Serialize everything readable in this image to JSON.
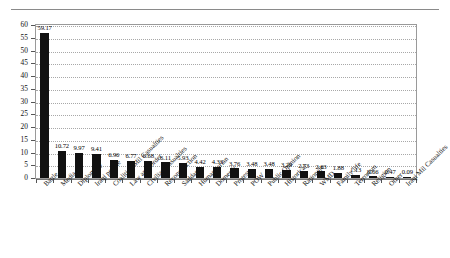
{
  "chart_data": {
    "type": "bar",
    "title": "",
    "subtitle": "",
    "xlabel": "",
    "ylabel": "",
    "ylim": [
      0,
      60
    ],
    "yticks": [
      0,
      5,
      10,
      15,
      20,
      25,
      30,
      35,
      40,
      45,
      50,
      55,
      60
    ],
    "grid": true,
    "legend": "none",
    "bar_color": "#111111",
    "categories": [
      "Battle",
      "Media",
      "Diplomacy",
      "Iraqi people",
      "Coalition Mil Casualties",
      "Law and Order",
      "Civilian Casualties",
      "Reconstruction",
      "Saddam",
      "Humanitarian",
      "Domestic",
      "Protest",
      "POW",
      "Public Opinion",
      "Historical",
      "Rationale",
      "WMD",
      "Family life",
      "Terrorism",
      "Religion",
      "Other",
      "Iraqi Mil Casualties"
    ],
    "values": [
      59.17,
      10.72,
      9.97,
      9.41,
      6.96,
      6.77,
      6.68,
      6.11,
      5.93,
      4.42,
      4.33,
      3.76,
      3.48,
      3.48,
      3.29,
      2.73,
      2.63,
      1.88,
      1.13,
      0.66,
      0.47,
      0.09
    ],
    "data_labels": [
      "59.17",
      "10.72",
      "9.97",
      "9.41",
      "6.96",
      "6.77",
      "6.68",
      "6.11",
      "5.93",
      "4.42",
      "4.33",
      "3.76",
      "3.48",
      "3.48",
      "3.29",
      "2.73",
      "2.63",
      "1.88",
      "1.13",
      "0.66",
      "0.47",
      "0.09"
    ]
  }
}
